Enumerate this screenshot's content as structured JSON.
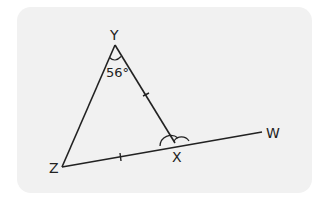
{
  "diagram": {
    "type": "geometry-triangle",
    "points": {
      "Y": {
        "label": "Y",
        "x": 115,
        "y": 45
      },
      "Z": {
        "label": "Z",
        "x": 62,
        "y": 167
      },
      "X": {
        "label": "X",
        "x": 175,
        "y": 143
      },
      "W": {
        "label": "W",
        "x": 262,
        "y": 132
      }
    },
    "angle_label": "56°",
    "angle_at": "Y",
    "equal_sides": [
      "YX",
      "ZX"
    ],
    "marked_angles_at_X": [
      "YXZ",
      "YXW"
    ],
    "colors": {
      "panel": "#f1f1f1",
      "stroke": "#222222"
    }
  }
}
